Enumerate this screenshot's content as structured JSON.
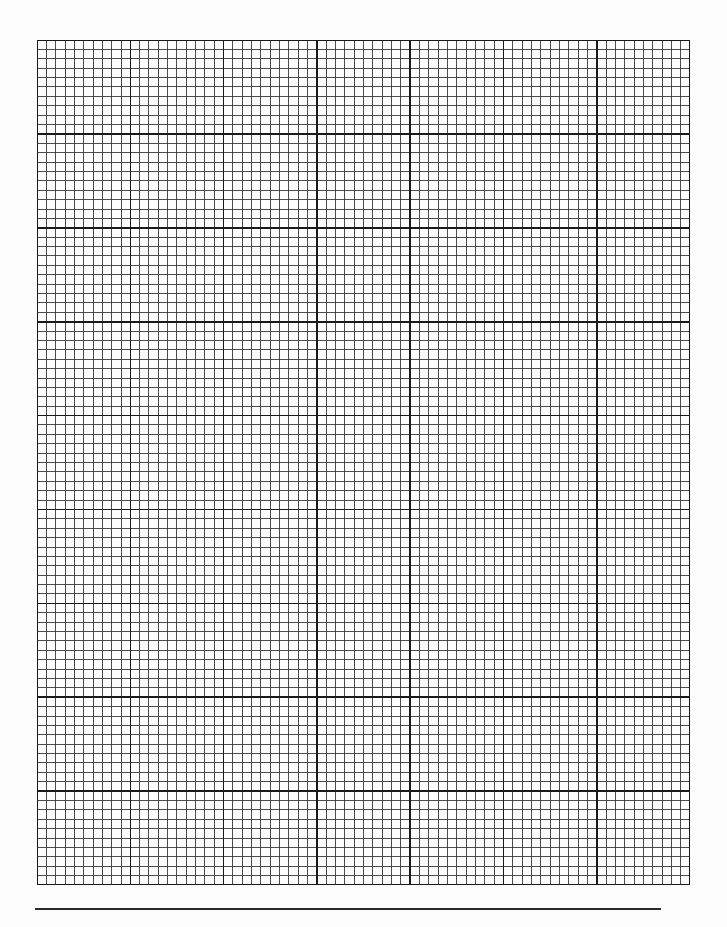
{
  "document": {
    "type": "graph-paper",
    "grid": {
      "major_columns": 7,
      "major_rows": 9,
      "minor_per_major": 10,
      "line_color": "#3a3a3a",
      "major_line_color": "#1a1a1a",
      "paper_color": "#fdfdfd"
    },
    "footer_rule": {
      "color": "#2a2a2a"
    }
  }
}
